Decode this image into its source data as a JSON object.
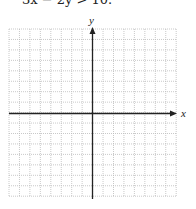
{
  "problem": {
    "text": "3x − 2y > 10."
  },
  "graph": {
    "x_label": "x",
    "y_label": "y",
    "grid": {
      "columns": 16,
      "rows": 16,
      "left": 9,
      "top": 29,
      "cell": 10.45
    },
    "axis_color": "#222222",
    "grid_color": "#bbbbbb"
  }
}
